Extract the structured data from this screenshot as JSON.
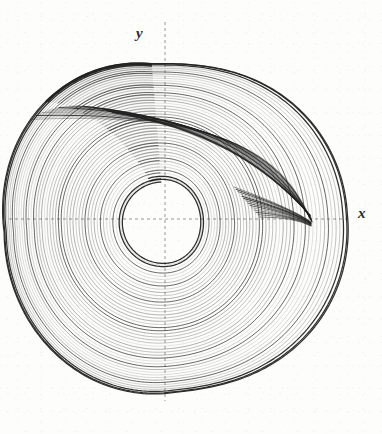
{
  "figure": {
    "title": "",
    "background_color": "#fdfdfc",
    "ink_color": "#1f1f1f",
    "axis_color": "#8a8a8a",
    "width": 382,
    "height": 434
  },
  "labels": {
    "x_axis": "x",
    "y_axis": "y"
  },
  "axes": {
    "origin": {
      "x": 165,
      "y": 219
    },
    "x_axis_line": {
      "x1": 9,
      "y1": 219,
      "x2": 350,
      "y2": 219
    },
    "y_axis_line": {
      "x1": 165,
      "y1": 22,
      "x2": 165,
      "y2": 401
    },
    "style": "dashed",
    "dash_pattern": "3 3",
    "ticks": [],
    "tick_labels": [],
    "grid": false,
    "legend": false
  },
  "chart_data": {
    "type": "line",
    "title": "",
    "subtitle": "",
    "xlabel": "x",
    "ylabel": "y",
    "series": [
      {
        "name": "attractor-trajectory",
        "kind": "nested-spiral-band",
        "loop_count": 46,
        "center": {
          "x": 163,
          "y": 222
        },
        "inner_radius": 40,
        "outer_radius_x": 140,
        "outer_radius_y": 152,
        "fold_cusp": {
          "x": 312,
          "y": 221
        },
        "color": "#1f1f1f"
      }
    ],
    "extent": {
      "left": 25,
      "right": 315,
      "top": 87,
      "bottom": 388
    },
    "xlim": [
      -1.0,
      1.0
    ],
    "ylim": [
      -1.0,
      1.0
    ],
    "grid": false,
    "legend_position": "none",
    "annotations": []
  }
}
